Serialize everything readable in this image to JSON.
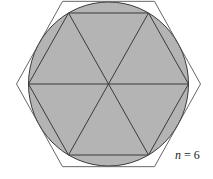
{
  "figure": {
    "label_var": "n",
    "label_eq": " = 6",
    "n": 6,
    "colors": {
      "circle_fill": "#b4b4b4",
      "stroke": "#3a3a3a",
      "outer_stroke": "#555555",
      "background": "#ffffff"
    }
  }
}
